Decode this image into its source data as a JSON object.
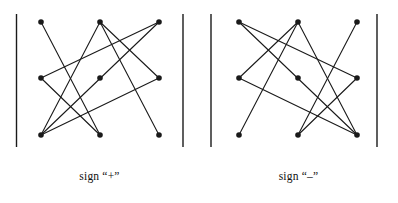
{
  "figure": {
    "type": "diagram",
    "background": "#ffffff",
    "ink_color": "#1a1a1a",
    "line_width": 1.1,
    "node_radius": 2.8,
    "bars": [
      {
        "name": "left-outer-bar",
        "x": 16.5,
        "y1": 14,
        "y2": 147
      },
      {
        "name": "left-inner-bar",
        "x": 183,
        "y1": 14,
        "y2": 147
      },
      {
        "name": "right-inner-bar",
        "x": 211,
        "y1": 14,
        "y2": 147
      },
      {
        "name": "right-outer-bar",
        "x": 377,
        "y1": 14,
        "y2": 147
      }
    ],
    "panels": [
      {
        "name": "sign-plus-panel",
        "caption": "sign “+”",
        "nodes": [
          {
            "id": "TL",
            "x": 41,
            "y": 22
          },
          {
            "id": "TM",
            "x": 100,
            "y": 22
          },
          {
            "id": "TR",
            "x": 159,
            "y": 22
          },
          {
            "id": "ML",
            "x": 41,
            "y": 78
          },
          {
            "id": "MM",
            "x": 100,
            "y": 78
          },
          {
            "id": "MR",
            "x": 159,
            "y": 78
          },
          {
            "id": "BL",
            "x": 41,
            "y": 135
          },
          {
            "id": "BM",
            "x": 100,
            "y": 135
          },
          {
            "id": "BR",
            "x": 159,
            "y": 135
          }
        ],
        "edges": [
          {
            "from": "TL",
            "to": "BM"
          },
          {
            "from": "TM",
            "to": "BL"
          },
          {
            "from": "TM",
            "to": "BR"
          },
          {
            "from": "TR",
            "to": "BL"
          },
          {
            "from": "TR",
            "to": "ML"
          },
          {
            "from": "ML",
            "to": "BM"
          },
          {
            "from": "MR",
            "to": "TM"
          },
          {
            "from": "MR",
            "to": "BL"
          }
        ]
      },
      {
        "name": "sign-minus-panel",
        "caption": "sign “–”",
        "nodes": [
          {
            "id": "TL",
            "x": 239,
            "y": 22
          },
          {
            "id": "TM",
            "x": 298,
            "y": 22
          },
          {
            "id": "TR",
            "x": 357,
            "y": 22
          },
          {
            "id": "ML",
            "x": 239,
            "y": 78
          },
          {
            "id": "MM",
            "x": 298,
            "y": 78
          },
          {
            "id": "MR",
            "x": 357,
            "y": 78
          },
          {
            "id": "BL",
            "x": 239,
            "y": 135
          },
          {
            "id": "BM",
            "x": 298,
            "y": 135
          },
          {
            "id": "BR",
            "x": 357,
            "y": 135
          }
        ],
        "edges": [
          {
            "from": "TR",
            "to": "BM"
          },
          {
            "from": "TM",
            "to": "BR"
          },
          {
            "from": "TM",
            "to": "BL"
          },
          {
            "from": "TL",
            "to": "BR"
          },
          {
            "from": "TL",
            "to": "MR"
          },
          {
            "from": "MR",
            "to": "BM"
          },
          {
            "from": "ML",
            "to": "TM"
          },
          {
            "from": "ML",
            "to": "BR"
          }
        ]
      }
    ]
  },
  "captions": {
    "left": "sign “+”",
    "right": "sign “–”"
  }
}
